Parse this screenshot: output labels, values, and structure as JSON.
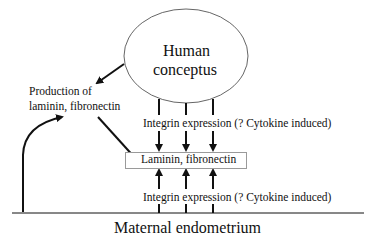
{
  "diagram": {
    "conceptus_label_line1": "Human",
    "conceptus_label_line2": "conceptus",
    "production_line1": "Production of",
    "production_line2": "laminin, fibronectin",
    "integrin_upper": "Integrin expression (? Cytokine induced)",
    "integrin_lower": "Integrin expression (? Cytokine induced)",
    "matrix_box": "Laminin, fibronectin",
    "base_label": "Maternal endometrium"
  },
  "colors": {
    "line": "#111111",
    "ellipse_stroke": "#666666",
    "box_border": "#9a9a9a"
  }
}
